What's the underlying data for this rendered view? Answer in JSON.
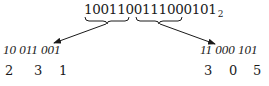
{
  "number": {
    "digits": "1001100111000101",
    "base_subscript": "2",
    "left_part": "10011001",
    "right_part": "11000101"
  },
  "left_group": {
    "triplets_label": "10 011 001",
    "octal_digits": [
      "2",
      "3",
      "1"
    ]
  },
  "right_group": {
    "triplets_label": "11 000 101",
    "octal_digits": [
      "3",
      "0",
      "5"
    ]
  },
  "colors": {
    "ink": "#1a1a1a",
    "background": "#ffffff"
  }
}
